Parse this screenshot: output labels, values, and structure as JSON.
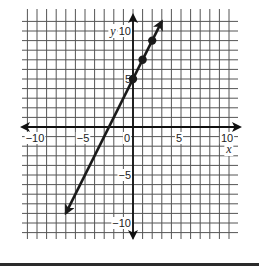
{
  "chart_data": {
    "type": "line",
    "title": "",
    "xlabel": "x",
    "ylabel": "y",
    "xlim": [
      -11.5,
      11
    ],
    "ylim": [
      -11.5,
      12
    ],
    "grid": true,
    "x_ticks": [
      -10,
      -5,
      0,
      5,
      10
    ],
    "y_ticks": [
      -10,
      -5,
      5,
      10
    ],
    "x_tick_labels": [
      "−10",
      "−5",
      "0",
      "5",
      "10"
    ],
    "y_tick_labels": [
      "−10",
      "−5",
      "5",
      "10"
    ],
    "series": [
      {
        "name": "y = 2x + 5",
        "equation": "y = 2x + 5",
        "line": {
          "from": [
            -7,
            -9
          ],
          "to": [
            3,
            11
          ],
          "arrows": "both"
        },
        "points": [
          {
            "x": 0,
            "y": 5
          },
          {
            "x": 1,
            "y": 7
          },
          {
            "x": 2,
            "y": 9
          }
        ]
      }
    ],
    "colors": {
      "grid": "#555555",
      "axis": "#111111",
      "line": "#1a1a1a"
    }
  },
  "layout": {
    "origin_px": [
      133,
      127
    ],
    "unit_px": 9.6,
    "grid_px": {
      "left": 22,
      "right": 238,
      "top": 13,
      "bottom": 236
    }
  }
}
